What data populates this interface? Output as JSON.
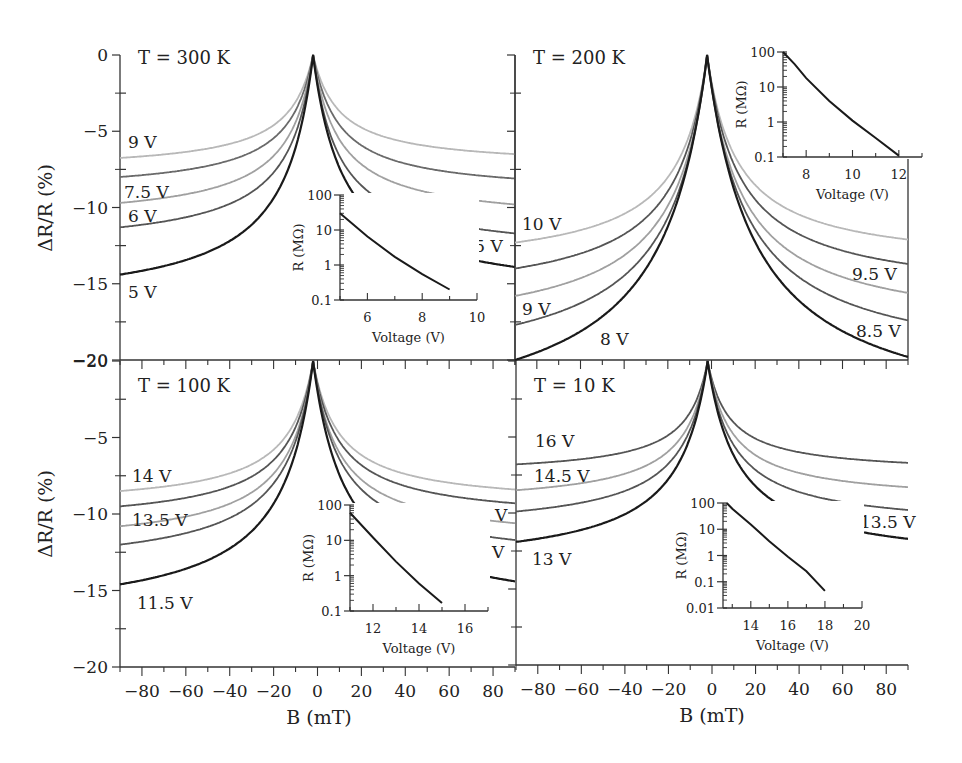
{
  "figure": {
    "ylabel": "ΔR/R (%)",
    "xlabel": "B (mT)",
    "inset_xlabel": "Voltage (V)",
    "inset_ylabel": "R (MΩ)"
  },
  "chart_data": [
    {
      "type": "line",
      "panel": "top-left",
      "title": "T = 300 K",
      "xlabel": "B (mT)",
      "ylabel": "ΔR/R (%)",
      "xlim": [
        -90,
        90
      ],
      "ylim": [
        -20,
        0
      ],
      "yticks": [
        0,
        -5,
        -10,
        -15,
        -20
      ],
      "xticks": [
        -80,
        -60,
        -40,
        -20,
        0,
        20,
        40,
        60,
        80
      ],
      "peak_B": -2,
      "series": [
        {
          "name": "9 V",
          "color": "#b8b8b8",
          "y_at_minus90": -6.75,
          "y_at_plus90": -6.5,
          "width": 12
        },
        {
          "name": "7.5 V",
          "color": "#6a6a6a",
          "y_at_minus90": -8.0,
          "y_at_plus90": -8.1,
          "width": 12
        },
        {
          "name": "6 V",
          "color": "#a0a0a0",
          "y_at_minus90": -9.7,
          "y_at_plus90": -9.8,
          "width": 12
        },
        {
          "name": "5.5 V",
          "color": "#555555",
          "y_at_minus90": -11.3,
          "y_at_plus90": -11.7,
          "width": 12
        },
        {
          "name": "5 V",
          "color": "#1a1a1a",
          "y_at_minus90": -14.4,
          "y_at_plus90": -13.9,
          "width": 14
        }
      ],
      "labels": [
        {
          "text": "9 V",
          "x": 128,
          "y": 148
        },
        {
          "text": "7.5 V",
          "x": 124,
          "y": 198
        },
        {
          "text": "6 V",
          "x": 128,
          "y": 222
        },
        {
          "text": "5.5 V",
          "x": 458,
          "y": 252
        },
        {
          "text": "5 V",
          "x": 128,
          "y": 298
        }
      ],
      "inset": {
        "xlabel": "Voltage (V)",
        "ylabel": "R (MΩ)",
        "xlim": [
          5,
          10
        ],
        "xticks": [
          6,
          8,
          10
        ],
        "ylim_log": [
          0.1,
          100
        ],
        "yticks": [
          "100",
          "10",
          "1",
          "0.1"
        ],
        "series": [
          {
            "x": [
              5.0,
              6.0,
              7.0,
              8.0,
              9.0
            ],
            "y": [
              30,
              6.5,
              1.7,
              0.55,
              0.2
            ]
          }
        ]
      }
    },
    {
      "type": "line",
      "panel": "top-right",
      "title": "T = 200 K",
      "xlabel": "B (mT)",
      "ylabel": "ΔR/R (%)",
      "xlim": [
        -90,
        90
      ],
      "ylim": [
        -20,
        0
      ],
      "peak_B": -2,
      "series": [
        {
          "name": "10 V",
          "color": "#b8b8b8",
          "y_at_minus90": -12.3,
          "y_at_plus90": -12.1,
          "width": 14
        },
        {
          "name": "9.5 V",
          "color": "#555555",
          "y_at_minus90": -14.0,
          "y_at_plus90": -13.7,
          "width": 15
        },
        {
          "name": "9 V",
          "color": "#a0a0a0",
          "y_at_minus90": -15.8,
          "y_at_plus90": -15.6,
          "width": 16
        },
        {
          "name": "8.5 V",
          "color": "#555555",
          "y_at_minus90": -17.7,
          "y_at_plus90": -17.4,
          "width": 18
        },
        {
          "name": "8 V",
          "color": "#1a1a1a",
          "y_at_minus90": -20.0,
          "y_at_plus90": -19.8,
          "width": 22
        }
      ],
      "labels": [
        {
          "text": "10 V",
          "x": 522,
          "y": 230
        },
        {
          "text": "9.5 V",
          "x": 852,
          "y": 280
        },
        {
          "text": "9 V",
          "x": 522,
          "y": 315
        },
        {
          "text": "8.5 V",
          "x": 856,
          "y": 337
        },
        {
          "text": "8 V",
          "x": 600,
          "y": 345
        }
      ],
      "inset": {
        "xlabel": "Voltage (V)",
        "ylabel": "R (MΩ)",
        "xlim": [
          7,
          13
        ],
        "xticks": [
          8,
          10,
          12
        ],
        "ylim_log": [
          0.1,
          100
        ],
        "yticks": [
          "100",
          "10",
          "1",
          "0.1"
        ],
        "series": [
          {
            "x": [
              7.0,
              7.5,
              8.0,
              9.0,
              10.0,
              11.0,
              12.0
            ],
            "y": [
              100,
              45,
              18,
              4,
              1.1,
              0.35,
              0.11
            ]
          }
        ]
      }
    },
    {
      "type": "line",
      "panel": "bottom-left",
      "title": "T = 100 K",
      "xlabel": "B (mT)",
      "ylabel": "ΔR/R (%)",
      "xlim": [
        -90,
        90
      ],
      "ylim": [
        -20,
        0
      ],
      "yticks": [
        -20,
        -5,
        -10,
        -15,
        -20
      ],
      "peak_B": -2,
      "series": [
        {
          "name": "14 V",
          "color": "#b8b8b8",
          "y_at_minus90": -8.5,
          "y_at_plus90": -8.4,
          "width": 12
        },
        {
          "name": "13.5 V",
          "color": "#555555",
          "y_at_minus90": -9.5,
          "y_at_plus90": -9.3,
          "width": 12
        },
        {
          "name": "13 V",
          "color": "#a0a0a0",
          "y_at_minus90": -10.8,
          "y_at_plus90": -10.6,
          "width": 12
        },
        {
          "name": "12 V",
          "color": "#555555",
          "y_at_minus90": -12.0,
          "y_at_plus90": -11.7,
          "width": 13
        },
        {
          "name": "11.5 V",
          "color": "#1a1a1a",
          "y_at_minus90": -14.6,
          "y_at_plus90": -14.4,
          "width": 15
        }
      ],
      "labels": [
        {
          "text": "14 V",
          "x": 132,
          "y": 482
        },
        {
          "text": "13.5 V",
          "x": 132,
          "y": 526
        },
        {
          "text": "13 V",
          "x": 468,
          "y": 521
        },
        {
          "text": "12 V",
          "x": 465,
          "y": 558
        },
        {
          "text": "11.5 V",
          "x": 137,
          "y": 609
        }
      ],
      "inset": {
        "xlabel": "Voltage (V)",
        "ylabel": "R (MΩ)",
        "xlim": [
          11,
          17
        ],
        "xticks": [
          12,
          14,
          16
        ],
        "ylim_log": [
          0.1,
          100
        ],
        "yticks": [
          "100",
          "10",
          "1",
          "0.1"
        ],
        "series": [
          {
            "x": [
              11.0,
              12.0,
              13.0,
              14.0,
              15.0
            ],
            "y": [
              60,
              12,
              2.5,
              0.6,
              0.17
            ]
          }
        ]
      }
    },
    {
      "type": "line",
      "panel": "bottom-right",
      "title": "T = 10 K",
      "xlabel": "B (mT)",
      "ylabel": "ΔR/R (%)",
      "xlim": [
        -90,
        90
      ],
      "ylim": [
        -20,
        0
      ],
      "peak_B": -2,
      "series": [
        {
          "name": "16 V",
          "color": "#555555",
          "y_at_minus90": -6.8,
          "y_at_plus90": -6.7,
          "width": 10
        },
        {
          "name": "14.5 V",
          "color": "#a0a0a0",
          "y_at_minus90": -8.5,
          "y_at_plus90": -8.3,
          "width": 11
        },
        {
          "name": "13.5 V",
          "color": "#555555",
          "y_at_minus90": -9.9,
          "y_at_plus90": -9.8,
          "width": 12
        },
        {
          "name": "13 V",
          "color": "#1a1a1a",
          "y_at_minus90": -11.9,
          "y_at_plus90": -11.7,
          "width": 14
        }
      ],
      "labels": [
        {
          "text": "16 V",
          "x": 535,
          "y": 447
        },
        {
          "text": "14.5 V",
          "x": 534,
          "y": 482
        },
        {
          "text": "13.5 V",
          "x": 860,
          "y": 528
        },
        {
          "text": "13 V",
          "x": 532,
          "y": 565
        }
      ],
      "inset": {
        "xlabel": "Voltage (V)",
        "ylabel": "R (MΩ)",
        "xlim": [
          12.5,
          20
        ],
        "xticks": [
          14,
          16,
          18,
          20
        ],
        "ylim_log": [
          0.01,
          100
        ],
        "yticks": [
          "100",
          "10",
          "1",
          "0.1",
          "0.01"
        ],
        "series": [
          {
            "x": [
              12.7,
              13.0,
              14.0,
              15.0,
              16.0,
              17.0,
              18.0
            ],
            "y": [
              100,
              60,
              15,
              3.5,
              0.9,
              0.25,
              0.045
            ]
          }
        ]
      }
    }
  ]
}
